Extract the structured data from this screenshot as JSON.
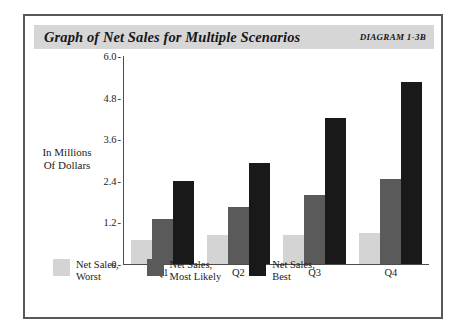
{
  "header": {
    "title": "Graph of Net Sales for Multiple Scenarios",
    "diagram_label": "DIAGRAM 1-3B"
  },
  "colors": {
    "worst": "#d4d4d4",
    "most_likely": "#5a5a5a",
    "best": "#191919",
    "frame": "#58585a",
    "title_bar": "#d6d6d6",
    "axis": "#4c4c4c"
  },
  "legend": {
    "items": [
      {
        "label": "Net Sales,\nWorst",
        "color_key": "worst"
      },
      {
        "label": "Net  Sales,\nMost Likely",
        "color_key": "most_likely"
      },
      {
        "label": "Net Sales,\nBest",
        "color_key": "best"
      }
    ]
  },
  "chart_data": {
    "type": "bar",
    "title": "Graph of Net Sales for Multiple Scenarios",
    "xlabel": "",
    "ylabel": "In Millions\nOf Dollars",
    "ylim": [
      0,
      6.0
    ],
    "yticks": [
      0,
      1.2,
      2.4,
      3.6,
      4.8,
      6.0
    ],
    "ytick_labels": [
      "0",
      "1.2",
      "2.4",
      "3.6",
      "4.8",
      "6.0"
    ],
    "grid": false,
    "legend_position": "bottom",
    "categories": [
      "Q1",
      "Q2",
      "Q3",
      "Q4"
    ],
    "series": [
      {
        "name": "Net Sales, Worst",
        "values": [
          0.7,
          0.85,
          0.85,
          0.9
        ]
      },
      {
        "name": "Net Sales, Most Likely",
        "values": [
          1.3,
          1.65,
          2.0,
          2.45
        ]
      },
      {
        "name": "Net Sales, Best",
        "values": [
          2.4,
          2.9,
          4.2,
          5.25
        ]
      }
    ]
  }
}
